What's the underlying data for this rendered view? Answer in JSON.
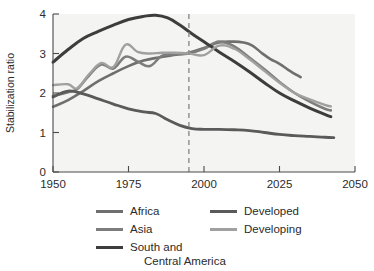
{
  "chart_data": {
    "type": "line",
    "title": "",
    "xlabel": "",
    "ylabel": "Stabilization ratio",
    "xlim": [
      1950,
      2050
    ],
    "ylim": [
      0,
      4
    ],
    "xticks": [
      1950,
      1975,
      2000,
      2025,
      2050
    ],
    "yticks": [
      0,
      1,
      2,
      3,
      4
    ],
    "grid": false,
    "legend_position": "below",
    "annotations": [
      {
        "type": "vertical-dashed-line",
        "x": 1995,
        "label": "",
        "color": "#8d8d8d"
      }
    ],
    "series": [
      {
        "name": "Africa",
        "color": "#6f6f6f",
        "width": 2.6,
        "x": [
          1950,
          1955,
          1960,
          1965,
          1970,
          1975,
          1980,
          1985,
          1990,
          1995,
          2000,
          2005,
          2010,
          2013,
          2016,
          2019,
          2022,
          2025,
          2028,
          2032
        ],
        "y": [
          1.65,
          1.82,
          2.05,
          2.3,
          2.5,
          2.68,
          2.82,
          2.9,
          2.96,
          3.02,
          3.14,
          3.28,
          3.3,
          3.28,
          3.2,
          3.02,
          2.86,
          2.74,
          2.58,
          2.4
        ]
      },
      {
        "name": "Asia",
        "color": "#7d7d7d",
        "width": 2.6,
        "x": [
          1950,
          1955,
          1958,
          1962,
          1966,
          1970,
          1974,
          1978,
          1982,
          1986,
          1990,
          1995,
          2000,
          2005,
          2010,
          2015,
          2020,
          2025,
          2030,
          2035,
          2040,
          2042
        ],
        "y": [
          1.93,
          2.02,
          2.1,
          2.45,
          2.72,
          2.62,
          2.92,
          2.8,
          2.68,
          2.94,
          2.98,
          3.0,
          3.12,
          3.3,
          3.18,
          2.9,
          2.6,
          2.28,
          2.0,
          1.78,
          1.6,
          1.56
        ]
      },
      {
        "name": "South and\nCentral America",
        "color": "#3d3d3d",
        "width": 3.0,
        "x": [
          1950,
          1955,
          1960,
          1965,
          1970,
          1975,
          1980,
          1984,
          1988,
          1992,
          1996,
          2000,
          2005,
          2010,
          2015,
          2020,
          2025,
          2030,
          2035,
          2040,
          2042
        ],
        "y": [
          2.78,
          3.1,
          3.38,
          3.56,
          3.72,
          3.86,
          3.94,
          3.97,
          3.9,
          3.72,
          3.5,
          3.3,
          3.04,
          2.8,
          2.54,
          2.26,
          2.0,
          1.8,
          1.62,
          1.46,
          1.4
        ]
      },
      {
        "name": "Developed",
        "color": "#5a5a5a",
        "width": 2.8,
        "x": [
          1950,
          1955,
          1960,
          1965,
          1970,
          1975,
          1980,
          1984,
          1988,
          1992,
          1996,
          2000,
          2005,
          2010,
          2015,
          2020,
          2025,
          2030,
          2035,
          2040,
          2043
        ],
        "y": [
          1.9,
          2.05,
          1.98,
          1.85,
          1.72,
          1.6,
          1.52,
          1.48,
          1.32,
          1.18,
          1.1,
          1.08,
          1.08,
          1.07,
          1.05,
          1.0,
          0.95,
          0.92,
          0.9,
          0.88,
          0.87
        ]
      },
      {
        "name": "Developing",
        "color": "#a0a0a0",
        "width": 2.4,
        "x": [
          1950,
          1955,
          1958,
          1962,
          1966,
          1970,
          1974,
          1978,
          1982,
          1986,
          1990,
          1995,
          2000,
          2005,
          2010,
          2015,
          2020,
          2025,
          2030,
          2035,
          2040,
          2042
        ],
        "y": [
          2.2,
          2.22,
          2.12,
          2.48,
          2.76,
          2.66,
          3.22,
          3.04,
          3.0,
          3.02,
          3.02,
          3.0,
          2.96,
          3.2,
          3.12,
          2.86,
          2.56,
          2.26,
          2.0,
          1.84,
          1.7,
          1.66
        ]
      }
    ]
  },
  "axes": {
    "y_title": "Stabilization ratio",
    "x_tick_labels": [
      "1950",
      "1975",
      "2000",
      "2025",
      "2050"
    ],
    "y_tick_labels": [
      "0",
      "1",
      "2",
      "3",
      "4"
    ]
  },
  "legend": {
    "items": [
      {
        "label": "Africa",
        "color": "#6f6f6f"
      },
      {
        "label": "Asia",
        "color": "#7d7d7d"
      },
      {
        "label_line1": "South and",
        "label_line2": "Central America",
        "color": "#3d3d3d"
      },
      {
        "label": "Developed",
        "color": "#5a5a5a"
      },
      {
        "label": "Developing",
        "color": "#a0a0a0"
      }
    ]
  },
  "colors": {
    "plot_background": "#f4f4f2",
    "axis": "#4a4a4a",
    "text": "#2b2b2b",
    "marker_line": "#8d8d8d"
  }
}
